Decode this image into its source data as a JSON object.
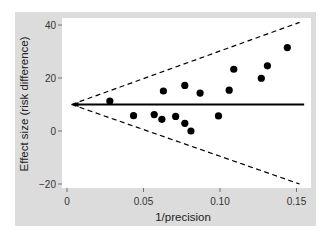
{
  "chart_data": {
    "type": "scatter",
    "title": "",
    "xlabel": "1/precision",
    "ylabel": "Effect size (risk difference)",
    "xlim": [
      0,
      0.155
    ],
    "ylim": [
      -21,
      41
    ],
    "xticks": [
      0,
      0.05,
      0.1,
      0.15
    ],
    "xtick_labels": [
      "0",
      "0.05",
      "0.10",
      "0.15"
    ],
    "yticks": [
      40,
      20,
      0,
      -20
    ],
    "ytick_labels": [
      "40",
      "20",
      "0",
      "−20"
    ],
    "grid": false,
    "legend": "none",
    "points": [
      {
        "x": 0.028,
        "y": 11.3
      },
      {
        "x": 0.0435,
        "y": 5.8
      },
      {
        "x": 0.057,
        "y": 6.2
      },
      {
        "x": 0.062,
        "y": 4.4
      },
      {
        "x": 0.063,
        "y": 15.1
      },
      {
        "x": 0.071,
        "y": 5.5
      },
      {
        "x": 0.077,
        "y": 17.2
      },
      {
        "x": 0.077,
        "y": 2.9
      },
      {
        "x": 0.081,
        "y": 0.0
      },
      {
        "x": 0.087,
        "y": 14.3
      },
      {
        "x": 0.099,
        "y": 5.7
      },
      {
        "x": 0.106,
        "y": 15.4
      },
      {
        "x": 0.109,
        "y": 23.3
      },
      {
        "x": 0.127,
        "y": 19.9
      },
      {
        "x": 0.131,
        "y": 24.6
      },
      {
        "x": 0.144,
        "y": 31.5
      }
    ],
    "reference_line": {
      "y": 10,
      "x_start": 0.003,
      "x_end": 0.155,
      "style": "solid",
      "arrow_at_start": true
    },
    "funnel_lines": [
      {
        "name": "upper-limit",
        "from": [
          0.003,
          10
        ],
        "to": [
          0.152,
          41
        ],
        "style": "dashed"
      },
      {
        "name": "lower-limit",
        "from": [
          0.003,
          10
        ],
        "to": [
          0.152,
          -20
        ],
        "style": "dashed"
      }
    ],
    "colors": {
      "points": "#000000",
      "lines": "#000000",
      "panel_background": "#dcdcdc",
      "plot_background": "#ffffff"
    }
  }
}
